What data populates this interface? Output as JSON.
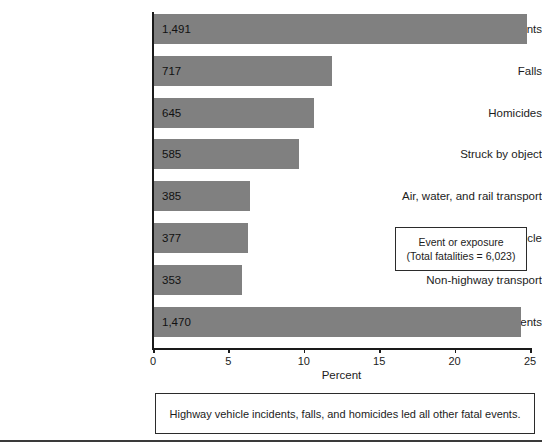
{
  "chart_data": {
    "type": "bar",
    "orientation": "horizontal",
    "title": "",
    "xlabel": "Percent",
    "ylabel": "",
    "xlim": [
      0,
      25
    ],
    "xticks": [
      0,
      5,
      10,
      15,
      20,
      25
    ],
    "grid": false,
    "categories": [
      "Highway incidents",
      "Falls",
      "Homicides",
      "Struck by object",
      "Air, water, and rail transport",
      "Worker struck by vehicle",
      "Non-highway transport",
      "All other events"
    ],
    "values": [
      24.8,
      11.9,
      10.7,
      9.7,
      6.4,
      6.3,
      5.9,
      24.4
    ],
    "data_labels": [
      "1,491",
      "717",
      "645",
      "585",
      "385",
      "377",
      "353",
      "1,470"
    ],
    "counts": [
      1491,
      717,
      645,
      585,
      385,
      377,
      353,
      1470
    ],
    "bar_color": "#808080",
    "legend": {
      "position": "inside-right",
      "line1": "Event or exposure",
      "line2": "(Total fatalities = 6,023)",
      "total_fatalities": 6023
    },
    "caption": "Highway vehicle incidents, falls, and homicides led all other fatal events."
  },
  "colors": {
    "bar": "#808080",
    "axis": "#1a1a1a",
    "box_border": "#2b2b2b",
    "text": "#1c1c1c",
    "background": "#ffffff"
  }
}
